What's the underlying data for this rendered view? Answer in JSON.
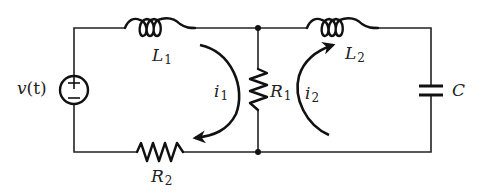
{
  "diagram": {
    "type": "two-mesh electrical circuit",
    "colors": {
      "line": "#222222",
      "background": "#ffffff"
    },
    "components": {
      "source": {
        "symbol": "v",
        "arg": "(t)",
        "plus": "+",
        "minus": "−"
      },
      "L1": {
        "symbol": "L",
        "sub": "1"
      },
      "L2": {
        "symbol": "L",
        "sub": "2"
      },
      "R1": {
        "symbol": "R",
        "sub": "1"
      },
      "R2": {
        "symbol": "R",
        "sub": "2"
      },
      "C": {
        "symbol": "C"
      }
    },
    "mesh_currents": {
      "i1": {
        "symbol": "i",
        "sub": "1",
        "direction": "clockwise"
      },
      "i2": {
        "symbol": "i",
        "sub": "2",
        "direction": "clockwise"
      }
    }
  }
}
